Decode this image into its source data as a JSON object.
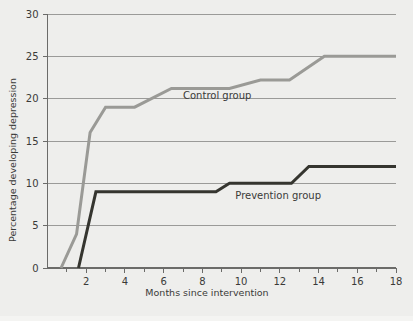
{
  "chart_data": {
    "type": "line",
    "title": "",
    "xlabel": "Months since intervention",
    "ylabel": "Percentage developing depression",
    "xlim": [
      0,
      18
    ],
    "ylim": [
      0,
      30
    ],
    "xticks": [
      0,
      2,
      4,
      6,
      8,
      10,
      12,
      14,
      16,
      18
    ],
    "xtick_labels": [
      "",
      "2",
      "4",
      "6",
      "8",
      "10",
      "12",
      "14",
      "16",
      "18"
    ],
    "xminor_ticks": [
      1,
      3,
      5,
      7,
      9,
      11,
      13,
      15,
      17
    ],
    "yticks": [
      0,
      5,
      10,
      15,
      20,
      25,
      30
    ],
    "ytick_labels": [
      "0",
      "5",
      "10",
      "15",
      "20",
      "25",
      "30"
    ],
    "grid": "horizontal",
    "legend_position": "inline-annotation",
    "series": [
      {
        "name": "Control group",
        "color": "#9a9a96",
        "label_text": "Control group",
        "label_x": 7.0,
        "label_y": 20.0,
        "points": [
          [
            0.7,
            0
          ],
          [
            1.5,
            4
          ],
          [
            2.2,
            16
          ],
          [
            3.0,
            19
          ],
          [
            4.5,
            19
          ],
          [
            6.4,
            21.2
          ],
          [
            9.4,
            21.2
          ],
          [
            11.0,
            22.2
          ],
          [
            12.5,
            22.2
          ],
          [
            14.3,
            25
          ],
          [
            18.0,
            25
          ]
        ]
      },
      {
        "name": "Prevention group",
        "color": "#35352f",
        "label_text": "Prevention group",
        "label_x": 9.7,
        "label_y": 8.2,
        "points": [
          [
            1.6,
            0
          ],
          [
            2.5,
            9
          ],
          [
            8.7,
            9
          ],
          [
            9.4,
            10
          ],
          [
            12.6,
            10
          ],
          [
            13.5,
            12
          ],
          [
            18.0,
            12
          ]
        ]
      }
    ]
  }
}
